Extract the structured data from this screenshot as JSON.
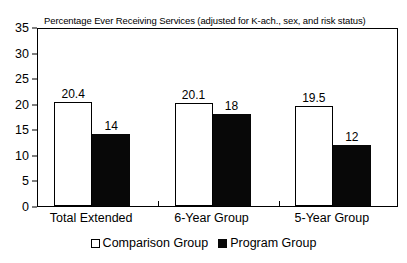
{
  "chart_data": {
    "type": "bar",
    "title": "Percentage Ever Receiving Services (adjusted for K-ach., sex, and risk status)",
    "xlabel": "",
    "ylabel": "",
    "ylim": [
      0,
      35
    ],
    "yticks": [
      0,
      5,
      10,
      15,
      20,
      25,
      30,
      35
    ],
    "ytick_labels": [
      "0",
      "5",
      "10",
      "15",
      "20",
      "25",
      "30",
      "35"
    ],
    "grid": false,
    "legend_position": "bottom-center",
    "categories": [
      "Total Extended",
      "6-Year Group",
      "5-Year Group"
    ],
    "series": [
      {
        "name": "Comparison Group",
        "color": "#ffffff",
        "edge_color": "#000000",
        "values": [
          20.4,
          20.1,
          19.5
        ],
        "value_labels": [
          "20.4",
          "20.1",
          "19.5"
        ]
      },
      {
        "name": "Program Group",
        "color": "#000000",
        "edge_color": "#000000",
        "values": [
          14,
          18,
          12
        ],
        "value_labels": [
          "14",
          "18",
          "12"
        ]
      }
    ]
  },
  "legend": {
    "items": [
      {
        "label": "Comparison Group",
        "swatch": "hollow-square-swatch"
      },
      {
        "label": "Program Group",
        "swatch": "filled-square-swatch"
      }
    ]
  }
}
